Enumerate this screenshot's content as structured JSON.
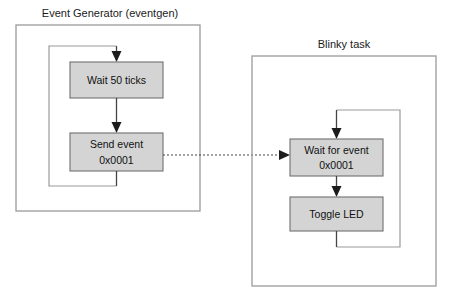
{
  "diagram": {
    "title_visible": false,
    "colors": {
      "node_fill": "#d4d4d4",
      "node_stroke": "#6f6f6f",
      "container_stroke": "#9a9a9a",
      "line": "#444444",
      "text": "#111111",
      "background": "#ffffff"
    },
    "containers": [
      {
        "id": "eventgen",
        "label": "Event Generator (eventgen)",
        "label_x": 110,
        "label_y": 17,
        "x": 16,
        "y": 25,
        "width": 184,
        "height": 186
      },
      {
        "id": "blinky",
        "label": "Blinky task",
        "label_x": 344,
        "label_y": 48,
        "x": 252,
        "y": 56,
        "width": 184,
        "height": 230
      }
    ],
    "nodes": [
      {
        "id": "wait-50-ticks",
        "lines": [
          "Wait 50 ticks"
        ],
        "x": 70,
        "y": 62,
        "width": 93,
        "height": 36,
        "container": "eventgen"
      },
      {
        "id": "send-event",
        "lines": [
          "Send event",
          "0x0001"
        ],
        "x": 70,
        "y": 133,
        "width": 93,
        "height": 38,
        "container": "eventgen"
      },
      {
        "id": "wait-for-event",
        "lines": [
          "Wait for event",
          "0x0001"
        ],
        "x": 290,
        "y": 139,
        "width": 93,
        "height": 37,
        "container": "blinky"
      },
      {
        "id": "toggle-led",
        "lines": [
          "Toggle LED"
        ],
        "x": 290,
        "y": 197,
        "width": 93,
        "height": 34,
        "container": "blinky"
      }
    ],
    "edges": [
      {
        "id": "eventgen-loop-entry",
        "from": "loop-return",
        "to": "wait-50-ticks",
        "style": "solid",
        "arrow": true
      },
      {
        "id": "wait-to-send",
        "from": "wait-50-ticks",
        "to": "send-event",
        "style": "solid",
        "arrow": true
      },
      {
        "id": "send-loop-back",
        "from": "send-event",
        "to": "wait-50-ticks",
        "style": "solid",
        "arrow": false
      },
      {
        "id": "event-signal",
        "from": "send-event",
        "to": "wait-for-event",
        "style": "dashed",
        "arrow": true
      },
      {
        "id": "blinky-loop-entry",
        "from": "loop-return",
        "to": "wait-for-event",
        "style": "solid",
        "arrow": true
      },
      {
        "id": "waitevent-to-toggle",
        "from": "wait-for-event",
        "to": "toggle-led",
        "style": "solid",
        "arrow": true
      },
      {
        "id": "toggle-loop-back",
        "from": "toggle-led",
        "to": "wait-for-event",
        "style": "solid",
        "arrow": false
      }
    ]
  }
}
